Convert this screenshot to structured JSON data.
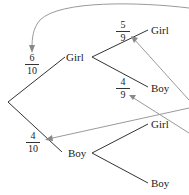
{
  "diagram": {
    "type": "tree-diagram",
    "root_branches": [
      {
        "label": "Girl",
        "probability": {
          "numerator": "6",
          "denominator": "10"
        },
        "children": [
          {
            "label": "Girl",
            "probability": {
              "numerator": "5",
              "denominator": "9"
            }
          },
          {
            "label": "Boy",
            "probability": {
              "numerator": "4",
              "denominator": "9"
            }
          }
        ]
      },
      {
        "label": "Boy",
        "probability": {
          "numerator": "4",
          "denominator": "10"
        },
        "children": [
          {
            "label": "Girl"
          },
          {
            "label": "Boy"
          }
        ]
      }
    ],
    "colors": {
      "branch": "#333333",
      "arrow": "#999999"
    }
  }
}
